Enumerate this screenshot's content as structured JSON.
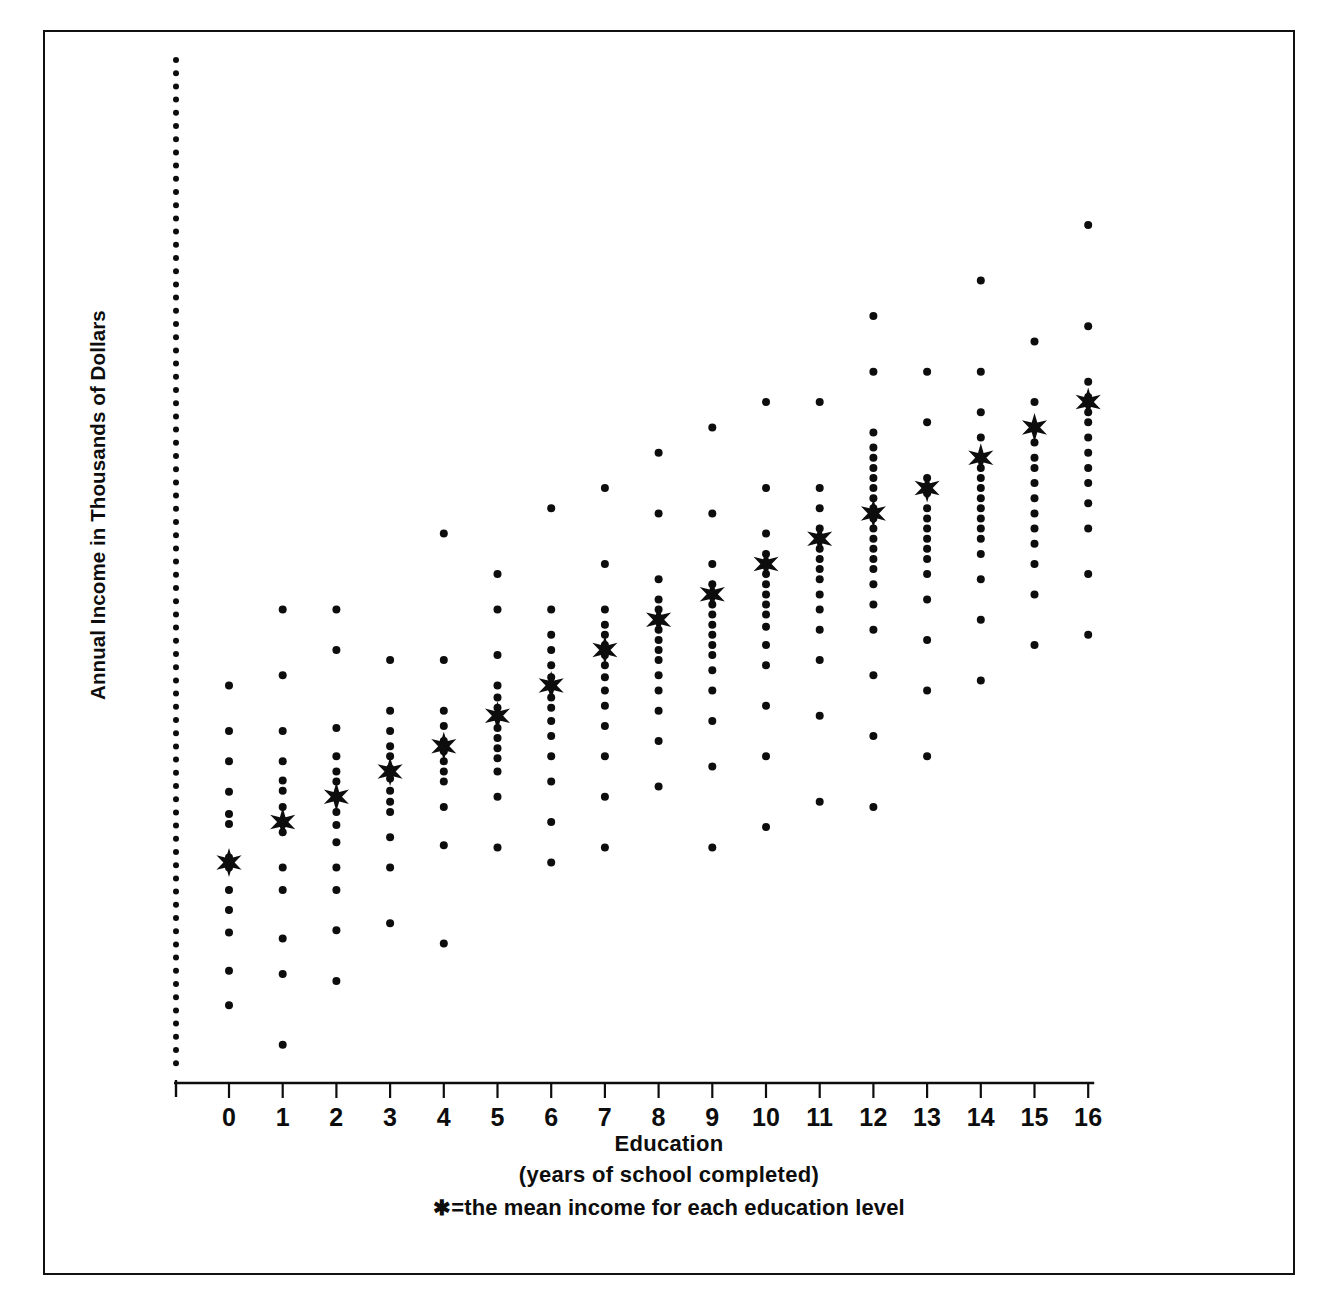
{
  "figure": {
    "y_axis_title": "Annual Income in Thousands of Dollars",
    "caption_title": "Education",
    "caption_sub": "(years of school completed)",
    "caption_legend": "★=the mean income for each education level",
    "legend_star_glyph": "✱",
    "frame_color": "#111111",
    "marker_color": "#0d0d0d"
  },
  "chart_data": {
    "type": "scatter",
    "title": "",
    "subtitle": "",
    "xlabel": "Education (years of school completed)",
    "ylabel": "Annual Income in Thousands of Dollars",
    "xlim": [
      -0.9,
      16.6
    ],
    "ylim": [
      0,
      100
    ],
    "grid": false,
    "legend_position": "below-axis",
    "legend": [
      "★ = the mean income for each education level"
    ],
    "annotations": [
      "★=the mean income for each education level"
    ],
    "xticks": [
      0,
      1,
      2,
      3,
      4,
      5,
      6,
      7,
      8,
      9,
      10,
      11,
      12,
      13,
      14,
      15,
      16
    ],
    "xtick_labels": [
      "0",
      "1",
      "2",
      "3",
      "4",
      "5",
      "6",
      "7",
      "8",
      "9",
      "10",
      "11",
      "12",
      "13",
      "14",
      "15",
      "16"
    ],
    "yticks": [],
    "ytick_labels": [],
    "y_axis_style": "dotted-unlabeled",
    "note": "Vertical axis drawn as a dense dotted line with no numeric tick labels. Each education level is a vertical column of individual observation dots; the star marks the column mean.",
    "series": [
      {
        "name": "Individual observations (income by years of schooling)",
        "marker": "dot",
        "columns": [
          {
            "x": 0,
            "y_values": [
              38.0,
              33.5,
              30.5,
              27.5,
              25.3,
              24.3,
              21.0,
              20.0,
              17.8,
              15.8,
              13.6,
              9.8,
              6.4
            ]
          },
          {
            "x": 1,
            "y_values": [
              45.5,
              39.0,
              33.5,
              30.5,
              28.6,
              27.6,
              26.0,
              24.5,
              23.5,
              20.0,
              17.8,
              13.0,
              9.5,
              2.5
            ]
          },
          {
            "x": 2,
            "y_values": [
              45.5,
              41.5,
              33.8,
              31.0,
              29.5,
              28.5,
              27.0,
              25.5,
              24.2,
              22.5,
              20.0,
              17.8,
              13.8,
              8.8
            ]
          },
          {
            "x": 3,
            "y_values": [
              40.5,
              35.5,
              33.5,
              32.0,
              31.0,
              29.8,
              28.8,
              27.6,
              26.5,
              25.5,
              23.0,
              20.0,
              14.5
            ]
          },
          {
            "x": 4,
            "y_values": [
              53.0,
              40.5,
              35.5,
              34.0,
              32.5,
              31.5,
              30.5,
              29.5,
              28.5,
              26.0,
              22.2,
              12.5
            ]
          },
          {
            "x": 5,
            "y_values": [
              49.0,
              45.5,
              41.0,
              38.0,
              36.8,
              35.8,
              34.8,
              33.8,
              32.8,
              31.8,
              30.8,
              29.5,
              27.0,
              22.0
            ]
          },
          {
            "x": 6,
            "y_values": [
              55.5,
              45.5,
              43.0,
              41.5,
              40.0,
              38.8,
              37.8,
              36.8,
              35.8,
              34.5,
              33.0,
              31.0,
              28.5,
              24.5,
              20.5
            ]
          },
          {
            "x": 7,
            "y_values": [
              57.5,
              50.0,
              45.5,
              44.0,
              43.0,
              42.0,
              41.0,
              40.0,
              38.8,
              37.5,
              36.0,
              34.0,
              31.0,
              27.0,
              22.0
            ]
          },
          {
            "x": 8,
            "y_values": [
              61.0,
              55.0,
              48.5,
              46.5,
              45.5,
              44.5,
              43.5,
              42.5,
              41.5,
              40.5,
              39.0,
              37.5,
              35.5,
              32.5,
              28.0
            ]
          },
          {
            "x": 9,
            "y_values": [
              63.5,
              55.0,
              50.0,
              48.0,
              47.0,
              46.0,
              45.0,
              44.0,
              43.0,
              42.0,
              41.0,
              39.5,
              37.5,
              34.5,
              30.0,
              22.0
            ]
          },
          {
            "x": 10,
            "y_values": [
              66.0,
              57.5,
              53.0,
              51.0,
              50.0,
              49.0,
              48.0,
              47.0,
              46.0,
              45.0,
              43.8,
              42.0,
              40.0,
              36.0,
              31.0,
              24.0
            ]
          },
          {
            "x": 11,
            "y_values": [
              66.0,
              57.5,
              55.5,
              53.5,
              52.5,
              51.5,
              50.5,
              49.5,
              48.5,
              47.0,
              45.5,
              43.5,
              40.5,
              35.0,
              26.5
            ]
          },
          {
            "x": 12,
            "y_values": [
              74.5,
              69.0,
              63.0,
              61.5,
              60.5,
              59.5,
              58.5,
              57.5,
              56.5,
              55.5,
              54.5,
              53.5,
              52.5,
              51.5,
              50.5,
              49.5,
              48.0,
              46.0,
              43.5,
              39.0,
              33.0,
              26.0
            ]
          },
          {
            "x": 13,
            "y_values": [
              69.0,
              64.0,
              58.5,
              57.0,
              55.5,
              54.5,
              53.5,
              52.5,
              51.5,
              50.5,
              49.0,
              46.5,
              42.5,
              37.5,
              31.0
            ]
          },
          {
            "x": 14,
            "y_values": [
              78.0,
              69.0,
              65.0,
              62.5,
              60.5,
              59.5,
              58.5,
              57.5,
              56.5,
              55.5,
              54.5,
              53.5,
              52.5,
              51.0,
              48.5,
              44.5,
              38.5
            ]
          },
          {
            "x": 15,
            "y_values": [
              72.0,
              66.0,
              63.5,
              62.0,
              60.5,
              59.5,
              58.0,
              56.5,
              55.0,
              53.5,
              52.0,
              50.0,
              47.0,
              42.0
            ]
          },
          {
            "x": 16,
            "y_values": [
              83.5,
              73.5,
              68.0,
              66.5,
              65.0,
              64.0,
              62.5,
              61.0,
              59.5,
              58.0,
              56.0,
              53.5,
              49.0,
              43.0
            ]
          }
        ]
      },
      {
        "name": "Mean income per education level",
        "marker": "star",
        "x": [
          0,
          1,
          2,
          3,
          4,
          5,
          6,
          7,
          8,
          9,
          10,
          11,
          12,
          13,
          14,
          15,
          16
        ],
        "values": [
          20.5,
          24.5,
          27.0,
          29.5,
          32.0,
          35.0,
          38.0,
          41.5,
          44.5,
          47.0,
          50.0,
          52.5,
          55.0,
          57.5,
          60.5,
          63.5,
          66.0
        ]
      }
    ]
  }
}
